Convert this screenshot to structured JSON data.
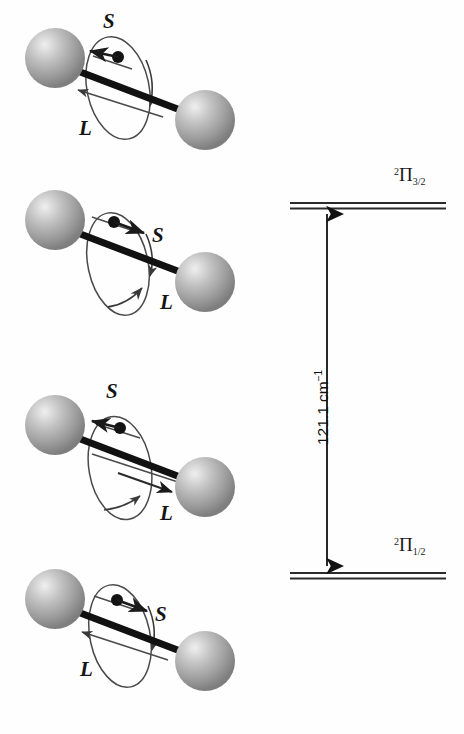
{
  "figure": {
    "background_color": "#fefefe",
    "sphere_color": "#9a9a9a",
    "sphere_highlight": "#e8e8e8",
    "bond_color": "#111111",
    "vector_color": "#1a1a1a"
  },
  "molecule_panels": [
    {
      "id": "panel-1",
      "spin_label": "S",
      "orbital_label": "L",
      "spin_direction": "left",
      "orbital_direction": "left",
      "alignment": "parallel",
      "state": "2Pi_1/2"
    },
    {
      "id": "panel-2",
      "spin_label": "S",
      "orbital_label": "L",
      "spin_direction": "right",
      "orbital_direction": "right",
      "alignment": "parallel",
      "state": "2Pi_3/2"
    },
    {
      "id": "panel-3",
      "spin_label": "S",
      "orbital_label": "L",
      "spin_direction": "left",
      "orbital_direction": "right",
      "alignment": "antiparallel",
      "state": "2Pi_1/2"
    },
    {
      "id": "panel-4",
      "spin_label": "S",
      "orbital_label": "L",
      "spin_direction": "right",
      "orbital_direction": "left",
      "alignment": "antiparallel",
      "state": "2Pi_1/2"
    }
  ],
  "energy_diagram": {
    "upper_level": {
      "superscript": "2",
      "term_symbol": "Π",
      "subscript": "3/2",
      "position": "top"
    },
    "lower_level": {
      "superscript": "2",
      "term_symbol": "Π",
      "subscript": "1/2",
      "position": "bottom"
    },
    "splitting": {
      "value": "121.1",
      "unit_base": "cm",
      "unit_exponent": "−1",
      "full_text": "121.1 cm⁻¹",
      "arrow_style": "double-headed-vertical"
    }
  }
}
